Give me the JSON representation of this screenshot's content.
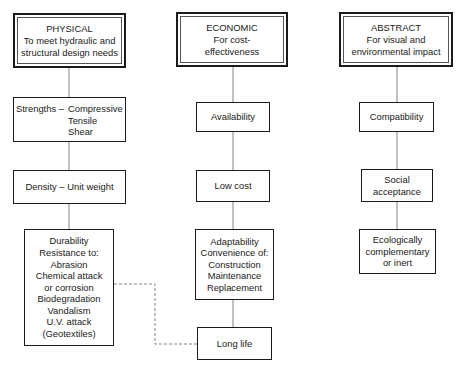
{
  "columns": {
    "physical": {
      "title": "PHYSICAL",
      "subtitle": [
        "To meet hydraulic and",
        "structural design needs"
      ],
      "strengths": {
        "label": "Strengths –",
        "values": [
          "Compressive",
          "Tensile",
          "Shear"
        ]
      },
      "density": "Density – Unit weight",
      "durability": [
        "Durability",
        "Resistance to:",
        "Abrasion",
        "Chemical attack",
        "or corrosion",
        "Biodegradation",
        "Vandalism",
        "U.V. attack",
        "(Geotextiles)"
      ]
    },
    "economic": {
      "title": "ECONOMIC",
      "subtitle": [
        "For cost-",
        "effectiveness"
      ],
      "availability": "Availability",
      "low_cost": "Low cost",
      "adaptability": [
        "Adaptability",
        "Convenience of:",
        "Construction",
        "Maintenance",
        "Replacement"
      ],
      "long_life": "Long life"
    },
    "abstract": {
      "title": "ABSTRACT",
      "subtitle": [
        "For visual and",
        "environmental impact"
      ],
      "compatibility": "Compatibility",
      "social": [
        "Social",
        "acceptance"
      ],
      "ecological": [
        "Ecologically",
        "complementary",
        "or inert"
      ]
    }
  },
  "connectors": {
    "solid_color": "#777777",
    "dashed_link": "Durability → Long life"
  }
}
